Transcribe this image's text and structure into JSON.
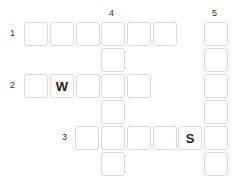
{
  "puzzle": {
    "type": "crossword",
    "colors": {
      "cell_border": "#d9d9d9",
      "cell_bg": "#ffffff",
      "letter": "#222222",
      "number": "#333333"
    },
    "clue_numbers": [
      {
        "label": "1",
        "x": 10,
        "y": 29
      },
      {
        "label": "2",
        "x": 10,
        "y": 81
      },
      {
        "label": "3",
        "x": 62,
        "y": 133
      },
      {
        "label": "4",
        "x": 109,
        "y": 9
      },
      {
        "label": "5",
        "x": 212,
        "y": 9
      }
    ],
    "cells": [
      {
        "id": "r1c1",
        "x": 24,
        "y": 22,
        "letter": ""
      },
      {
        "id": "r1c2",
        "x": 50,
        "y": 22,
        "letter": ""
      },
      {
        "id": "r1c3",
        "x": 76,
        "y": 22,
        "letter": ""
      },
      {
        "id": "r1c4",
        "x": 101,
        "y": 22,
        "letter": ""
      },
      {
        "id": "r1c5",
        "x": 127,
        "y": 22,
        "letter": ""
      },
      {
        "id": "r1c6",
        "x": 153,
        "y": 22,
        "letter": ""
      },
      {
        "id": "c5r1",
        "x": 204,
        "y": 22,
        "letter": ""
      },
      {
        "id": "c4r2",
        "x": 101,
        "y": 48,
        "letter": ""
      },
      {
        "id": "c5r2",
        "x": 204,
        "y": 48,
        "letter": ""
      },
      {
        "id": "r2c1",
        "x": 24,
        "y": 74,
        "letter": ""
      },
      {
        "id": "r2c2",
        "x": 50,
        "y": 74,
        "letter": "W"
      },
      {
        "id": "r2c3",
        "x": 76,
        "y": 74,
        "letter": ""
      },
      {
        "id": "r2c4",
        "x": 101,
        "y": 74,
        "letter": ""
      },
      {
        "id": "r2c5",
        "x": 127,
        "y": 74,
        "letter": ""
      },
      {
        "id": "c5r3",
        "x": 204,
        "y": 74,
        "letter": ""
      },
      {
        "id": "c4r4",
        "x": 101,
        "y": 100,
        "letter": ""
      },
      {
        "id": "c5r4",
        "x": 204,
        "y": 100,
        "letter": ""
      },
      {
        "id": "r3c1",
        "x": 75,
        "y": 126,
        "letter": ""
      },
      {
        "id": "r3c2",
        "x": 101,
        "y": 126,
        "letter": ""
      },
      {
        "id": "r3c3",
        "x": 127,
        "y": 126,
        "letter": ""
      },
      {
        "id": "r3c4",
        "x": 153,
        "y": 126,
        "letter": ""
      },
      {
        "id": "r3c5",
        "x": 178,
        "y": 126,
        "letter": "S"
      },
      {
        "id": "r3c6",
        "x": 204,
        "y": 126,
        "letter": ""
      },
      {
        "id": "c4r6",
        "x": 101,
        "y": 152,
        "letter": ""
      },
      {
        "id": "c5r6",
        "x": 204,
        "y": 152,
        "letter": ""
      }
    ]
  }
}
